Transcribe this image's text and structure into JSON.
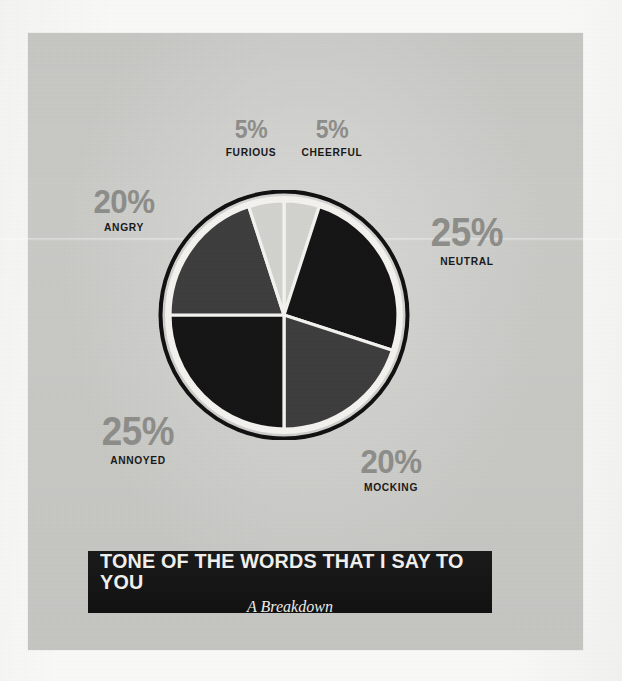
{
  "banner": {
    "title": "TONE OF THE WORDS THAT I SAY TO YOU",
    "subtitle": "A Breakdown"
  },
  "colors": {
    "page": "#fafaf8",
    "panel": "#c9c9c6",
    "banner_background": "#111111",
    "banner_text": "#f2f1ee",
    "percent_text": "#8d8d8a",
    "name_text": "#181818",
    "slice_dark": "#141414",
    "slice_medium": "#3d3d3d",
    "slice_light": "#d2d2cf",
    "slice_divider": "#f4f3f0",
    "ring": "#101010"
  },
  "chart_data": {
    "type": "pie",
    "title": "TONE OF THE WORDS THAT I SAY TO YOU",
    "subtitle": "A Breakdown",
    "start_angle_deg": 0,
    "direction": "clockwise",
    "total": 100,
    "unit": "%",
    "labels": [
      "CHEERFUL",
      "NEUTRAL",
      "MOCKING",
      "ANNOYED",
      "ANGRY",
      "FURIOUS"
    ],
    "values": [
      5,
      25,
      20,
      25,
      20,
      5
    ],
    "slices": [
      {
        "label": "CHEERFUL",
        "value": 5,
        "percent": "5%",
        "color": "#d2d2cf",
        "start_deg": 0,
        "end_deg": 18,
        "size_class": "small"
      },
      {
        "label": "NEUTRAL",
        "value": 25,
        "percent": "25%",
        "color": "#141414",
        "start_deg": 18,
        "end_deg": 108,
        "size_class": "big"
      },
      {
        "label": "MOCKING",
        "value": 20,
        "percent": "20%",
        "color": "#3d3d3d",
        "start_deg": 108,
        "end_deg": 180,
        "size_class": "mid"
      },
      {
        "label": "ANNOYED",
        "value": 25,
        "percent": "25%",
        "color": "#141414",
        "start_deg": 180,
        "end_deg": 270,
        "size_class": "big"
      },
      {
        "label": "ANGRY",
        "value": 20,
        "percent": "20%",
        "color": "#3d3d3d",
        "start_deg": 270,
        "end_deg": 342,
        "size_class": "mid"
      },
      {
        "label": "FURIOUS",
        "value": 5,
        "percent": "5%",
        "color": "#d2d2cf",
        "start_deg": 342,
        "end_deg": 360,
        "size_class": "small"
      }
    ],
    "legend": "callout labels around pie",
    "grid": false
  }
}
